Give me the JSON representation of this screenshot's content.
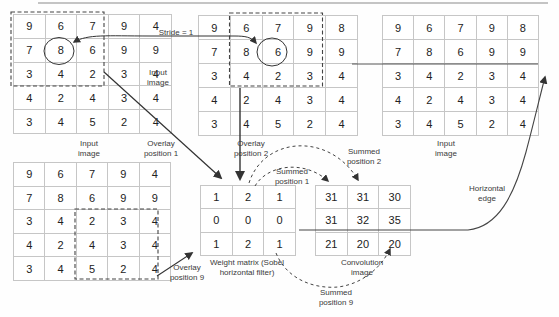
{
  "diagram": {
    "stride_label": "Stride = 1",
    "grids": {
      "input_a": {
        "rows": [
          [
            9,
            6,
            7,
            9,
            4
          ],
          [
            7,
            8,
            6,
            9,
            9
          ],
          [
            3,
            4,
            2,
            3,
            4
          ],
          [
            4,
            2,
            4,
            3,
            4
          ],
          [
            3,
            4,
            5,
            2,
            4
          ]
        ]
      },
      "input_b": {
        "rows": [
          [
            9,
            6,
            7,
            9,
            8
          ],
          [
            7,
            8,
            6,
            9,
            9
          ],
          [
            3,
            4,
            2,
            3,
            4
          ],
          [
            4,
            2,
            4,
            3,
            4
          ],
          [
            3,
            4,
            5,
            2,
            4
          ]
        ]
      },
      "input_c": {
        "rows": [
          [
            9,
            6,
            7,
            9,
            8
          ],
          [
            7,
            8,
            6,
            9,
            9
          ],
          [
            3,
            4,
            2,
            3,
            4
          ],
          [
            4,
            2,
            4,
            3,
            4
          ],
          [
            3,
            4,
            5,
            2,
            4
          ]
        ]
      },
      "input_d": {
        "rows": [
          [
            9,
            6,
            7,
            9,
            4
          ],
          [
            7,
            8,
            6,
            9,
            9
          ],
          [
            3,
            4,
            2,
            3,
            4
          ],
          [
            4,
            2,
            4,
            3,
            4
          ],
          [
            3,
            4,
            5,
            2,
            4
          ]
        ]
      },
      "weight_matrix": {
        "rows": [
          [
            1,
            2,
            1
          ],
          [
            0,
            0,
            0
          ],
          [
            1,
            2,
            1
          ]
        ]
      },
      "convolution": {
        "rows": [
          [
            31,
            31,
            30
          ],
          [
            31,
            32,
            35
          ],
          [
            21,
            20,
            20
          ]
        ]
      }
    },
    "labels": {
      "input_image_a": "Input image",
      "input_image_b": "Input image",
      "input_image_c": "Input image",
      "overlay_1": "Overlay position 1",
      "overlay_2": "Overlay position 2",
      "overlay_9": "Overlay position 9",
      "summed_1": "Summed position 1",
      "summed_2": "Summed position 2",
      "summed_9": "Summed position 9",
      "horizontal_edge": "Horizontal edge",
      "weight_matrix": "Weight matrix (Sobel horizontal filter)",
      "convolution": "Convolution image"
    },
    "highlighted_values": {
      "input_a_circled": 8,
      "input_b_circled": 6
    },
    "colors": {
      "ink": "#333333",
      "grid_line": "#c6c6c6",
      "label_text": "#3a3a3a"
    }
  }
}
